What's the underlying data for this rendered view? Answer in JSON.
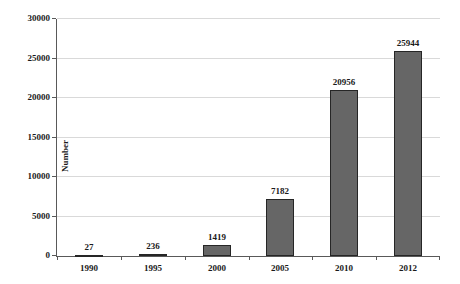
{
  "chart_data": {
    "type": "bar",
    "title": "",
    "categories": [
      "1990",
      "1995",
      "2000",
      "2005",
      "2010",
      "2012"
    ],
    "values": [
      27,
      236,
      1419,
      7182,
      20956,
      25944
    ],
    "value_labels": [
      "27",
      "236",
      "1419",
      "7182",
      "20956",
      "25944"
    ],
    "xlabel": "",
    "ylabel": "Number",
    "ylim": [
      0,
      30000
    ],
    "yticks": [
      0,
      5000,
      10000,
      15000,
      20000,
      25000,
      30000
    ],
    "grid": "horizontal",
    "legend_position": "none",
    "colors": {
      "bar_fill": "#666666",
      "bar_border": "#262626",
      "gridline": "#d9d9d9",
      "axis": "#595959",
      "text": "#1a1a1a",
      "background": "#ffffff"
    }
  }
}
